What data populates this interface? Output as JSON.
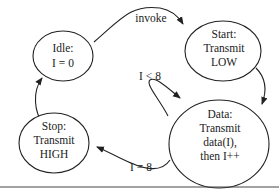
{
  "diagram": {
    "type": "state-machine",
    "nodes": [
      {
        "id": "idle",
        "lines": [
          "Idle:",
          "I = 0"
        ]
      },
      {
        "id": "start",
        "lines": [
          "Start:",
          "Transmit",
          "LOW"
        ]
      },
      {
        "id": "data",
        "lines": [
          "Data:",
          "Transmit",
          "data(I),",
          "then I++"
        ]
      },
      {
        "id": "stop",
        "lines": [
          "Stop:",
          "Transmit",
          "HIGH"
        ]
      }
    ],
    "edges": [
      {
        "from": "idle",
        "to": "start",
        "label": "invoke"
      },
      {
        "from": "start",
        "to": "data",
        "label": ""
      },
      {
        "from": "data",
        "to": "data",
        "label": "I < 8"
      },
      {
        "from": "data",
        "to": "stop",
        "label": "I = 8"
      },
      {
        "from": "stop",
        "to": "idle",
        "label": ""
      }
    ]
  }
}
